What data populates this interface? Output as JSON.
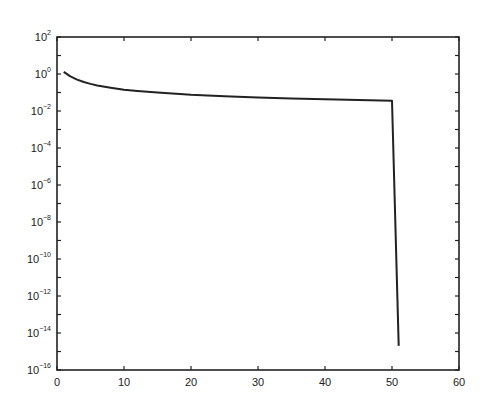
{
  "chart_data": {
    "type": "line",
    "title": "",
    "xlabel": "",
    "ylabel": "",
    "xscale": "linear",
    "yscale": "log",
    "xlim": [
      0,
      60
    ],
    "ylim": [
      1e-16,
      100
    ],
    "grid": false,
    "legend": null,
    "x_ticks": [
      0,
      10,
      20,
      30,
      40,
      50,
      60
    ],
    "x_tick_labels": [
      "0",
      "10",
      "20",
      "30",
      "40",
      "50",
      "60"
    ],
    "y_tick_exponents": [
      2,
      0,
      -2,
      -4,
      -6,
      -8,
      -10,
      -12,
      -14,
      -16
    ],
    "y_tick_labels": [
      "10^2",
      "10^0",
      "10^-2",
      "10^-4",
      "10^-6",
      "10^-8",
      "10^-10",
      "10^-12",
      "10^-14",
      "10^-16"
    ],
    "series": [
      {
        "name": "curve",
        "color": "#222222",
        "x": [
          1,
          2,
          3,
          4,
          5,
          6,
          8,
          10,
          12,
          15,
          20,
          25,
          30,
          35,
          40,
          45,
          50,
          51
        ],
        "y": [
          1.3,
          0.75,
          0.5,
          0.37,
          0.29,
          0.24,
          0.18,
          0.14,
          0.12,
          0.1,
          0.075,
          0.062,
          0.053,
          0.047,
          0.043,
          0.039,
          0.036,
          2e-15
        ]
      }
    ]
  },
  "colors": {
    "axis": "#222222",
    "line": "#222222",
    "background": "#ffffff"
  }
}
